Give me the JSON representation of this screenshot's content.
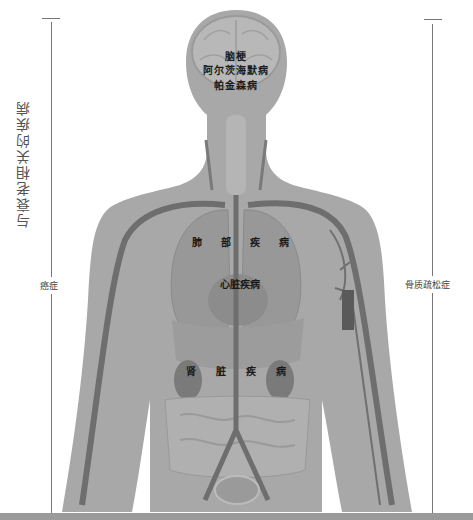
{
  "diagram": {
    "title": "与衰老相关的疾病",
    "left_annotation": "癌症",
    "right_annotation": "骨质疏松症",
    "brain_labels": [
      "脑梗",
      "阿尔茨海默病",
      "帕金森病"
    ],
    "lung_label_chars": [
      "肺",
      "部",
      "疾",
      "病"
    ],
    "heart_label": "心脏疾病",
    "kidney_label_chars": [
      "肾",
      "脏",
      "疾",
      "病"
    ]
  },
  "colors": {
    "silhouette": "#a6a6a6",
    "silhouette_dark": "#8e8e8e",
    "vessel": "#6e6e6e",
    "organ": "#7d7d7d",
    "line": "#777777",
    "bottom_bar": "#9a9a9a"
  }
}
